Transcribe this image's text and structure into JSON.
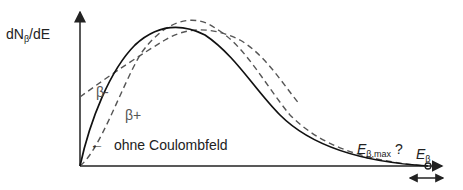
{
  "diagram": {
    "y_axis": {
      "label_prefix": "dN",
      "label_sub": "β",
      "label_suffix": "/dE"
    },
    "x_axis": {
      "label": "E",
      "label_sub": "β"
    },
    "curves": [
      {
        "name": "ohne Coulombfeld",
        "style": "solid",
        "color": "#111111"
      },
      {
        "name": "β-",
        "style": "dashed",
        "color": "#555555"
      },
      {
        "name": "β+",
        "style": "dashed",
        "color": "#555555"
      }
    ],
    "labels": {
      "beta_minus": "β-",
      "beta_plus": "β+",
      "no_coulomb": "ohne Coulombfeld",
      "emax_main": "E",
      "emax_sub": "β,max",
      "emax_q": " ?",
      "arrow_left": "←"
    },
    "colors": {
      "solid": "#111111",
      "dashed": "#555555",
      "axis": "#222222"
    }
  }
}
